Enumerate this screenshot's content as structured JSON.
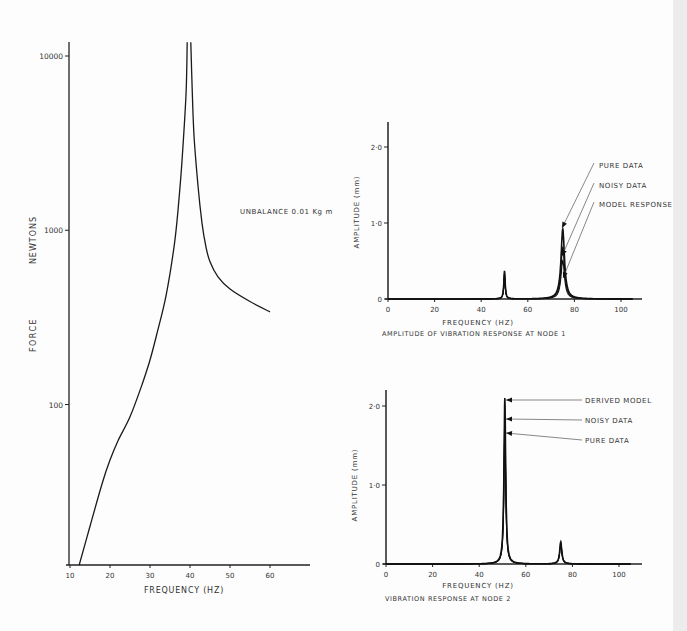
{
  "chart_data": [
    {
      "id": "force",
      "type": "line",
      "title": "",
      "xlabel": "FREQUENCY  (HZ)",
      "ylabel_parts": [
        "FORCE",
        "NEWTONS"
      ],
      "yscale": "log",
      "xlim": [
        10,
        70
      ],
      "ylim": [
        12,
        12000
      ],
      "xticks": [
        10,
        20,
        30,
        40,
        50,
        60
      ],
      "yticks": [
        {
          "value": 100,
          "label": "100"
        },
        {
          "value": 1000,
          "label": "1000"
        },
        {
          "value": 10000,
          "label": "10000"
        }
      ],
      "grid": false,
      "annotations": [
        {
          "text": "UNBALANCE  0.01 Kg m",
          "x": 55,
          "y": 1000
        }
      ],
      "series": [
        {
          "name": "force response",
          "x": [
            12.3,
            15,
            18,
            20,
            22,
            25,
            28,
            30,
            32,
            34,
            36,
            37,
            38,
            39,
            39.3
          ],
          "y": [
            12,
            20,
            35,
            48,
            62,
            85,
            130,
            180,
            270,
            420,
            800,
            1300,
            2500,
            6000,
            12000
          ]
        },
        {
          "name": "force response (post-resonance)",
          "x": [
            40.2,
            40.5,
            41,
            42,
            43,
            44,
            45,
            47,
            50,
            55,
            60
          ],
          "y": [
            12000,
            7000,
            3500,
            1800,
            1100,
            800,
            660,
            540,
            460,
            390,
            340
          ]
        }
      ]
    },
    {
      "id": "node1",
      "type": "line",
      "title": "AMPLITUDE OF VIBRATION RESPONSE AT NODE 1",
      "xlabel": "FREQUENCY (HZ)",
      "ylabel": "AMPLITUDE  (mm)",
      "xlim": [
        0,
        105
      ],
      "ylim": [
        0,
        2.4
      ],
      "xticks": [
        0,
        20,
        40,
        60,
        80,
        100
      ],
      "yticks": [
        {
          "value": 0,
          "label": "0"
        },
        {
          "value": 1.0,
          "label": "1·0"
        },
        {
          "value": 2.0,
          "label": "2·0"
        }
      ],
      "grid": false,
      "legend": [
        "PURE DATA",
        "NOISY DATA",
        "MODEL RESPONSE"
      ],
      "peaks": [
        {
          "x": 50,
          "y": 0.37
        },
        {
          "x": 75,
          "y": 0.92
        }
      ],
      "series": [
        {
          "name": "PURE DATA",
          "x": [
            0,
            40,
            48,
            49.5,
            50,
            50.5,
            52,
            60,
            70,
            73,
            74.5,
            75,
            75.5,
            77,
            80,
            90,
            100
          ],
          "y": [
            0,
            0.01,
            0.05,
            0.2,
            0.37,
            0.2,
            0.05,
            0.02,
            0.06,
            0.2,
            0.6,
            0.92,
            0.6,
            0.2,
            0.08,
            0.02,
            0.01
          ]
        },
        {
          "name": "NOISY DATA",
          "x": [
            0,
            40,
            48,
            49.5,
            50,
            50.5,
            52,
            60,
            70,
            73,
            74.5,
            75,
            75.5,
            77,
            80,
            90,
            100
          ],
          "y": [
            0,
            0.01,
            0.04,
            0.18,
            0.34,
            0.18,
            0.04,
            0.02,
            0.05,
            0.18,
            0.5,
            0.68,
            0.5,
            0.18,
            0.07,
            0.02,
            0.01
          ]
        },
        {
          "name": "MODEL RESPONSE",
          "x": [
            0,
            40,
            48,
            49.5,
            50,
            50.5,
            52,
            60,
            70,
            73,
            74.5,
            75,
            75.5,
            77,
            80,
            90,
            100
          ],
          "y": [
            0,
            0.01,
            0.03,
            0.15,
            0.3,
            0.15,
            0.03,
            0.02,
            0.04,
            0.15,
            0.4,
            0.5,
            0.4,
            0.15,
            0.06,
            0.02,
            0.01
          ]
        }
      ]
    },
    {
      "id": "node2",
      "type": "line",
      "title": "VIBRATION RESPONSE AT NODE 2",
      "xlabel": "FREQUENCY (HZ)",
      "ylabel": "AMPLITUDE  (mm)",
      "xlim": [
        0,
        105
      ],
      "ylim": [
        0,
        2.2
      ],
      "xticks": [
        0,
        20,
        40,
        60,
        80,
        100
      ],
      "yticks": [
        {
          "value": 0,
          "label": "0"
        },
        {
          "value": 1.0,
          "label": "1·0"
        },
        {
          "value": 2.0,
          "label": "2·0"
        }
      ],
      "grid": false,
      "legend": [
        "DERIVED MODEL",
        "NOISY DATA",
        "PURE DATA"
      ],
      "peaks": [
        {
          "x": 51,
          "y": 2.1
        },
        {
          "x": 75,
          "y": 0.28
        }
      ],
      "series": [
        {
          "name": "DERIVED MODEL",
          "x": [
            0,
            20,
            40,
            46,
            49,
            50.5,
            51,
            51.5,
            53,
            56,
            65,
            72,
            74,
            75,
            76,
            78,
            90,
            100
          ],
          "y": [
            0,
            0.02,
            0.06,
            0.1,
            0.3,
            1.2,
            2.1,
            1.2,
            0.3,
            0.1,
            0.05,
            0.05,
            0.15,
            0.28,
            0.15,
            0.04,
            0.01,
            0.01
          ]
        },
        {
          "name": "NOISY DATA",
          "x": [
            0,
            20,
            40,
            46,
            49,
            50.5,
            51,
            51.5,
            53,
            56,
            65,
            72,
            74,
            75,
            76,
            78,
            90,
            100
          ],
          "y": [
            0,
            0.02,
            0.05,
            0.08,
            0.25,
            1.1,
            1.82,
            1.1,
            0.25,
            0.08,
            0.04,
            0.05,
            0.14,
            0.26,
            0.14,
            0.04,
            0.01,
            0.01
          ]
        },
        {
          "name": "PURE DATA",
          "x": [
            0,
            20,
            40,
            46,
            49,
            50.5,
            51,
            51.5,
            53,
            56,
            65,
            72,
            74,
            75,
            76,
            78,
            90,
            100
          ],
          "y": [
            0,
            0.01,
            0.04,
            0.07,
            0.2,
            1.0,
            1.68,
            1.0,
            0.2,
            0.07,
            0.04,
            0.04,
            0.13,
            0.25,
            0.13,
            0.04,
            0.01,
            0.01
          ]
        }
      ]
    }
  ]
}
